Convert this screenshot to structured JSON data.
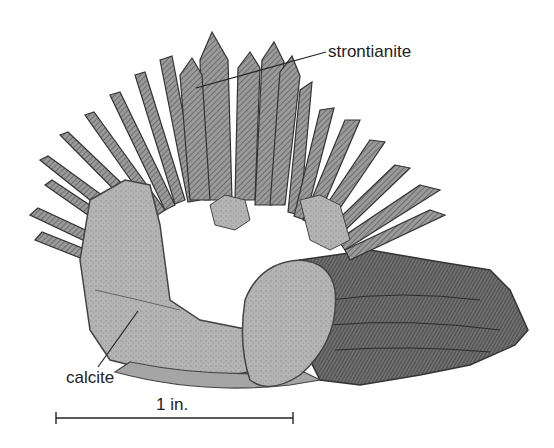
{
  "figure": {
    "labels": {
      "top": "strontianite",
      "bottom_left": "calcite"
    },
    "scale_bar": {
      "label": "1 in."
    }
  }
}
